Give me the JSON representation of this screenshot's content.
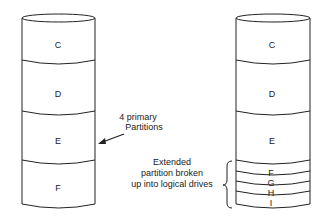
{
  "left_disk": {
    "partitions": [
      "C",
      "D",
      "E",
      "F"
    ]
  },
  "right_disk": {
    "partitions": [
      "C",
      "D",
      "E"
    ],
    "logical_drives": [
      "F",
      "G",
      "H",
      "I"
    ]
  },
  "annotations": {
    "primary_line1": "4 primary",
    "primary_line2": "Partitions",
    "extended_line1": "Extended",
    "extended_line2": "partition broken",
    "extended_line3": "up into logical drives"
  }
}
